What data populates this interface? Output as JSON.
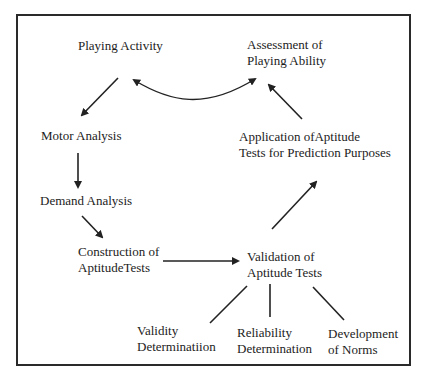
{
  "diagram": {
    "type": "flowchart",
    "colors": {
      "line": "#222222",
      "text": "#1c1c1c",
      "frame": "#2a2a2a",
      "background": "#ffffff"
    },
    "nodes": [
      {
        "id": "playing-activity",
        "lines": [
          "Playing Activity"
        ]
      },
      {
        "id": "assessment-of-playing-ability",
        "lines": [
          "Assessment of",
          "Playing Ability"
        ]
      },
      {
        "id": "motor-analysis",
        "lines": [
          "Motor Analysis"
        ]
      },
      {
        "id": "application-of-aptitude-tests",
        "lines": [
          "Application ofAptitude",
          "Tests for Prediction Purposes"
        ]
      },
      {
        "id": "demand-analysis",
        "lines": [
          "Demand Analysis"
        ]
      },
      {
        "id": "construction-of-aptitude-tests",
        "lines": [
          "Construction of",
          "AptitudeTests"
        ]
      },
      {
        "id": "validation-of-aptitude-tests",
        "lines": [
          "Validation of",
          "Aptitude Tests"
        ]
      },
      {
        "id": "validity-determination",
        "lines": [
          "Validity",
          "Determinatiion"
        ]
      },
      {
        "id": "reliability-determination",
        "lines": [
          "Reliability",
          "Determination"
        ]
      },
      {
        "id": "development-of-norms",
        "lines": [
          "Development",
          "of Norms"
        ]
      }
    ],
    "edges": [
      {
        "from": "playing-activity",
        "to": "motor-analysis",
        "style": "arrow"
      },
      {
        "from": "motor-analysis",
        "to": "demand-analysis",
        "style": "arrow"
      },
      {
        "from": "demand-analysis",
        "to": "construction-of-aptitude-tests",
        "style": "arrow"
      },
      {
        "from": "construction-of-aptitude-tests",
        "to": "validation-of-aptitude-tests",
        "style": "arrow"
      },
      {
        "from": "validation-of-aptitude-tests",
        "to": "application-of-aptitude-tests",
        "style": "arrow"
      },
      {
        "from": "application-of-aptitude-tests",
        "to": "assessment-of-playing-ability",
        "style": "arrow"
      },
      {
        "from": "assessment-of-playing-ability",
        "to": "playing-activity",
        "style": "curved-double-arrow"
      },
      {
        "from": "validation-of-aptitude-tests",
        "to": "validity-determination",
        "style": "line"
      },
      {
        "from": "validation-of-aptitude-tests",
        "to": "reliability-determination",
        "style": "line"
      },
      {
        "from": "validation-of-aptitude-tests",
        "to": "development-of-norms",
        "style": "line"
      }
    ]
  }
}
